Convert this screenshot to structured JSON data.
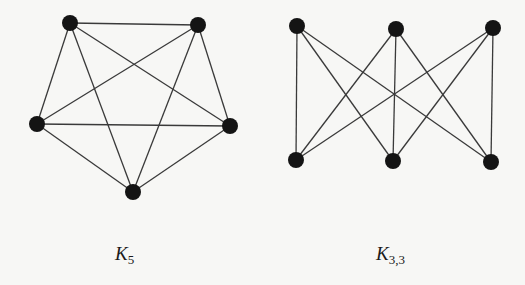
{
  "figures": [
    {
      "id": "k5",
      "label_main": "K",
      "label_sub": "5",
      "label_pos": [
        115,
        244
      ],
      "vertices": [
        [
          70,
          23
        ],
        [
          198,
          25
        ],
        [
          37,
          124
        ],
        [
          230,
          126
        ],
        [
          133,
          192
        ]
      ],
      "edges": [
        [
          0,
          1
        ],
        [
          0,
          2
        ],
        [
          0,
          3
        ],
        [
          0,
          4
        ],
        [
          1,
          2
        ],
        [
          1,
          3
        ],
        [
          1,
          4
        ],
        [
          2,
          3
        ],
        [
          2,
          4
        ],
        [
          3,
          4
        ]
      ]
    },
    {
      "id": "k33",
      "label_main": "K",
      "label_sub": "3,3",
      "label_pos": [
        376,
        244
      ],
      "vertices": [
        [
          297,
          26
        ],
        [
          396,
          29
        ],
        [
          493,
          28
        ],
        [
          296,
          160
        ],
        [
          393,
          161
        ],
        [
          491,
          162
        ]
      ],
      "edges": [
        [
          0,
          3
        ],
        [
          0,
          4
        ],
        [
          0,
          5
        ],
        [
          1,
          3
        ],
        [
          1,
          4
        ],
        [
          1,
          5
        ],
        [
          2,
          3
        ],
        [
          2,
          4
        ],
        [
          2,
          5
        ]
      ]
    }
  ],
  "style": {
    "vertex_radius": 8,
    "vertex_color": "#141414",
    "edge_color": "#3a3a3a",
    "background": "#f7f7f5"
  }
}
